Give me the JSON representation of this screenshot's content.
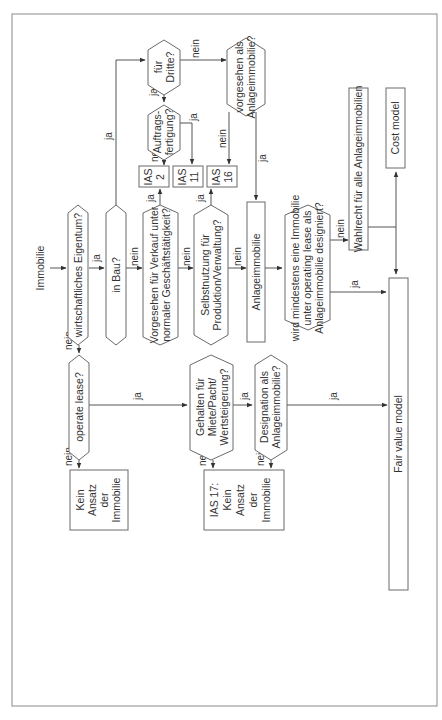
{
  "diagram": {
    "orientation": "rotated-90-ccw",
    "start": "Immobilie",
    "nodes": {
      "wirtschaftliches_eigentum": {
        "type": "decision",
        "text": [
          "wirtschaftliches Eigentum?"
        ]
      },
      "in_bau": {
        "type": "decision",
        "text": [
          "in Bau?"
        ]
      },
      "vorgesehen_verkauf": {
        "type": "decision",
        "text": [
          "Vorgesehen für Verkauf unter",
          "normaler Geschäftstätigkeit?"
        ]
      },
      "selbstnutzung": {
        "type": "decision",
        "text": [
          "Selbstnutzung für",
          "Produktion/Verwaltung?"
        ]
      },
      "anlageimmobilie": {
        "type": "process",
        "text": [
          "Anlageimmobilie"
        ]
      },
      "wird_mindestens": {
        "type": "decision",
        "text": [
          "wird mindestens eine Immobilie",
          "unter operating lease als",
          "Anlageimmobilie designiert?"
        ]
      },
      "wahlrecht": {
        "type": "process",
        "text": [
          "Wahlrecht für alle Anlageimmobilien"
        ]
      },
      "cost_model": {
        "type": "process",
        "text": [
          "Cost model"
        ]
      },
      "fair_value_model": {
        "type": "process",
        "text": [
          "Fair value  model"
        ]
      },
      "fuer_dritte": {
        "type": "decision",
        "text": [
          "für",
          "Dritte?"
        ]
      },
      "auftragsfertigung": {
        "type": "decision",
        "text": [
          "Auftrags-",
          "fertigung?"
        ]
      },
      "ias2": {
        "type": "process",
        "text": [
          "IAS",
          "2"
        ]
      },
      "ias11": {
        "type": "process",
        "text": [
          "IAS",
          "11"
        ]
      },
      "ias16": {
        "type": "process",
        "text": [
          "IAS",
          "16"
        ]
      },
      "vorgesehen_als": {
        "type": "decision",
        "text": [
          "vorgesehen als",
          "Anlageimmobilie?"
        ]
      },
      "operate_lease": {
        "type": "decision",
        "text": [
          "operate lease?"
        ]
      },
      "gehalten_fuer": {
        "type": "decision",
        "text": [
          "Gehalten für",
          "Miete/Pacht/",
          "Wertsteigerung?"
        ]
      },
      "designation_als": {
        "type": "decision",
        "text": [
          "Designation als",
          "Anlageimmobilie?"
        ]
      },
      "kein_ansatz_1": {
        "type": "process",
        "text": [
          "Kein",
          "Ansatz",
          "der",
          "Immobilie"
        ]
      },
      "kein_ansatz_2": {
        "type": "process",
        "text": [
          "IAS 17:",
          "Kein",
          "Ansatz",
          "der",
          "Immobilie"
        ]
      }
    },
    "edges": [
      {
        "from": "start",
        "to": "wirtschaftliches_eigentum",
        "label": ""
      },
      {
        "from": "wirtschaftliches_eigentum",
        "to": "in_bau",
        "label": "ja"
      },
      {
        "from": "wirtschaftliches_eigentum",
        "to": "operate_lease",
        "label": "nein"
      },
      {
        "from": "in_bau",
        "to": "fuer_dritte",
        "label": "ja"
      },
      {
        "from": "in_bau",
        "to": "vorgesehen_verkauf",
        "label": "nein"
      },
      {
        "from": "vorgesehen_verkauf",
        "to": "ias2",
        "label": "ja"
      },
      {
        "from": "vorgesehen_verkauf",
        "to": "selbstnutzung",
        "label": "nein"
      },
      {
        "from": "selbstnutzung",
        "to": "ias16",
        "label": "ja"
      },
      {
        "from": "selbstnutzung",
        "to": "anlageimmobilie",
        "label": "nein"
      },
      {
        "from": "fuer_dritte",
        "to": "auftragsfertigung",
        "label": "ja"
      },
      {
        "from": "fuer_dritte",
        "to": "vorgesehen_als",
        "label": "nein"
      },
      {
        "from": "auftragsfertigung",
        "to": "ias2",
        "label": "nein"
      },
      {
        "from": "auftragsfertigung",
        "to": "ias11",
        "label": "ja"
      },
      {
        "from": "vorgesehen_als",
        "to": "ias16",
        "label": "nein"
      },
      {
        "from": "vorgesehen_als",
        "to": "anlageimmobilie",
        "label": "ja"
      },
      {
        "from": "anlageimmobilie",
        "to": "wird_mindestens",
        "label": ""
      },
      {
        "from": "wird_mindestens",
        "to": "wahlrecht",
        "label": "nein"
      },
      {
        "from": "wird_mindestens",
        "to": "fair_value_model",
        "label": "ja"
      },
      {
        "from": "wahlrecht",
        "to": "cost_model",
        "label": ""
      },
      {
        "from": "wahlrecht",
        "to": "fair_value_model",
        "label": ""
      },
      {
        "from": "operate_lease",
        "to": "gehalten_fuer",
        "label": "ja"
      },
      {
        "from": "operate_lease",
        "to": "kein_ansatz_1",
        "label": "nein"
      },
      {
        "from": "gehalten_fuer",
        "to": "designation_als",
        "label": "ja"
      },
      {
        "from": "gehalten_fuer",
        "to": "kein_ansatz_2",
        "label": "nein"
      },
      {
        "from": "designation_als",
        "to": "fair_value_model",
        "label": "ja"
      },
      {
        "from": "designation_als",
        "to": "kein_ansatz_2",
        "label": "nein"
      }
    ]
  },
  "labels": {
    "immobilie": "Immobilie",
    "ja": "ja",
    "nein": "nein",
    "n_wirt": "wirtschaftliches Eigentum?",
    "n_inbau": "in Bau?",
    "n_verkauf_1": "Vorgesehen für Verkauf unter",
    "n_verkauf_2": "normaler Geschäftstätigkeit?",
    "n_selbst_1": "Selbstnutzung für",
    "n_selbst_2": "Produktion/Verwaltung?",
    "n_anlage": "Anlageimmobilie",
    "n_wird_1": "wird mindestens eine Immobilie",
    "n_wird_2": "unter operating lease als",
    "n_wird_3": "Anlageimmobilie designiert?",
    "n_wahl": "Wahlrecht für alle Anlageimmobilien",
    "n_cost": "Cost model",
    "n_fair": "Fair value  model",
    "n_dritte_1": "für",
    "n_dritte_2": "Dritte?",
    "n_auftrag_1": "Auftrags-",
    "n_auftrag_2": "fertigung?",
    "n_ias": "IAS",
    "n_ias2": "2",
    "n_ias11": "11",
    "n_ias16": "16",
    "n_vorg_1": "vorgesehen als",
    "n_vorg_2": "Anlageimmobilie?",
    "n_op": "operate lease?",
    "n_geh_1": "Gehalten für",
    "n_geh_2": "Miete/Pacht/",
    "n_geh_3": "Wertsteigerung?",
    "n_des_1": "Designation als",
    "n_des_2": "Anlageimmobilie?",
    "n_kein": "Kein",
    "n_ansatz": "Ansatz",
    "n_der": "der",
    "n_immob": "Immobilie",
    "n_ias17": "IAS 17:"
  }
}
